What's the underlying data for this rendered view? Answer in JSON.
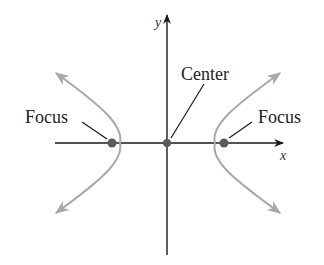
{
  "diagram": {
    "axes": {
      "x_label": "x",
      "y_label": "y"
    },
    "labels": {
      "center": "Center",
      "focus_left": "Focus",
      "focus_right": "Focus"
    },
    "colors": {
      "axis": "#1a1a1a",
      "curve": "#a8a8a8",
      "point": "#5a5a5a",
      "text": "#222222"
    },
    "points": [
      {
        "name": "Focus",
        "x": -1,
        "y": 0
      },
      {
        "name": "Center",
        "x": 0,
        "y": 0
      },
      {
        "name": "Focus",
        "x": 1,
        "y": 0
      }
    ]
  }
}
